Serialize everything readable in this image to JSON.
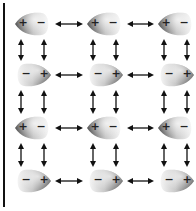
{
  "diagram": {
    "rows": 4,
    "columns": 3,
    "colors": {
      "lobe_light": "#f4f4f4",
      "lobe_dark": "#555555",
      "arrow": "#111111",
      "rule": "#111111"
    },
    "grid": [
      [
        {
          "orientation": "point-left",
          "left_sign": "+",
          "right_sign": "−"
        },
        {
          "orientation": "point-left",
          "left_sign": "+",
          "right_sign": "−"
        },
        {
          "orientation": "point-left",
          "left_sign": "+",
          "right_sign": "−"
        }
      ],
      [
        {
          "orientation": "point-right",
          "left_sign": "−",
          "right_sign": "+"
        },
        {
          "orientation": "point-right",
          "left_sign": "−",
          "right_sign": "+"
        },
        {
          "orientation": "point-right",
          "left_sign": "−",
          "right_sign": "+"
        }
      ],
      [
        {
          "orientation": "point-left",
          "left_sign": "+",
          "right_sign": "−"
        },
        {
          "orientation": "point-left",
          "left_sign": "+",
          "right_sign": "−"
        },
        {
          "orientation": "point-left",
          "left_sign": "+",
          "right_sign": "−"
        }
      ],
      [
        {
          "orientation": "point-right",
          "left_sign": "−",
          "right_sign": "+"
        },
        {
          "orientation": "point-right",
          "left_sign": "−",
          "right_sign": "+"
        },
        {
          "orientation": "point-right",
          "left_sign": "−",
          "right_sign": "+"
        }
      ]
    ],
    "arrows": {
      "horizontal": "double-headed between adjacent dipoles in each row",
      "vertical": "two double-headed arrows between each pair of vertically adjacent dipoles"
    }
  }
}
